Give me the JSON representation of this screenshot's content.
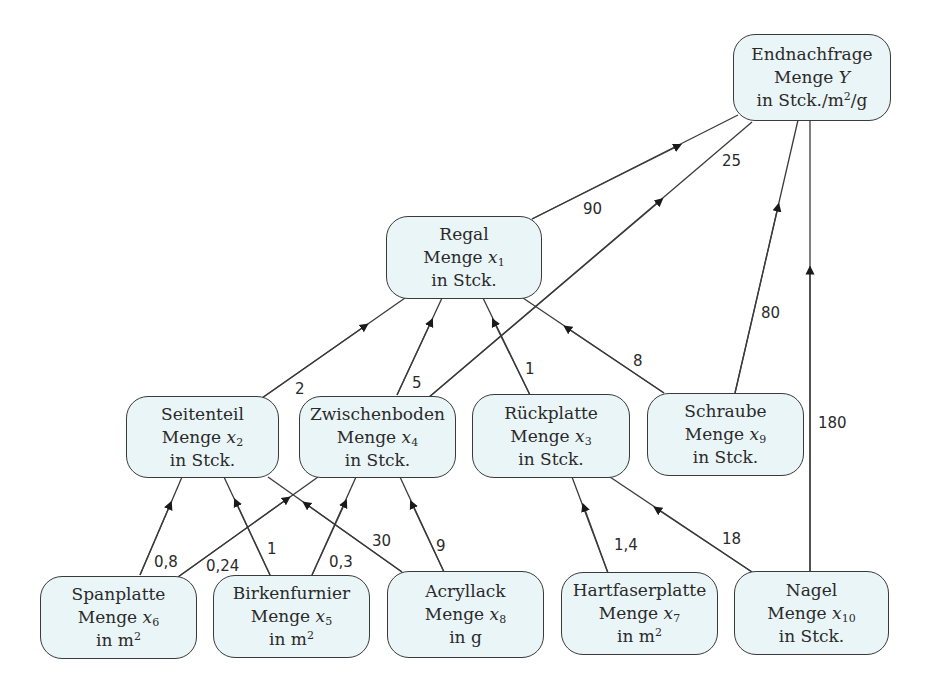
{
  "nodes": {
    "endnachfrage": {
      "title": "Endnachfrage",
      "menge_prefix": "Menge ",
      "var": "Y",
      "sub": "",
      "unit_prefix": "in Stck./m",
      "unit_sup": "2",
      "unit_suffix": "/g"
    },
    "regal": {
      "title": "Regal",
      "menge_prefix": "Menge ",
      "var": "x",
      "sub": "1",
      "unit_prefix": "in Stck.",
      "unit_sup": "",
      "unit_suffix": ""
    },
    "seitenteil": {
      "title": "Seitenteil",
      "menge_prefix": "Menge ",
      "var": "x",
      "sub": "2",
      "unit_prefix": "in Stck.",
      "unit_sup": "",
      "unit_suffix": ""
    },
    "zwischenboden": {
      "title": "Zwischenboden",
      "menge_prefix": "Menge ",
      "var": "x",
      "sub": "4",
      "unit_prefix": "in Stck.",
      "unit_sup": "",
      "unit_suffix": ""
    },
    "rueckplatte": {
      "title": "Rückplatte",
      "menge_prefix": "Menge ",
      "var": "x",
      "sub": "3",
      "unit_prefix": "in Stck.",
      "unit_sup": "",
      "unit_suffix": ""
    },
    "schraube": {
      "title": "Schraube",
      "menge_prefix": "Menge ",
      "var": "x",
      "sub": "9",
      "unit_prefix": "in Stck.",
      "unit_sup": "",
      "unit_suffix": ""
    },
    "spanplatte": {
      "title": "Spanplatte",
      "menge_prefix": "Menge ",
      "var": "x",
      "sub": "6",
      "unit_prefix": "in m",
      "unit_sup": "2",
      "unit_suffix": ""
    },
    "birkenfurnier": {
      "title": "Birkenfurnier",
      "menge_prefix": "Menge ",
      "var": "x",
      "sub": "5",
      "unit_prefix": "in m",
      "unit_sup": "2",
      "unit_suffix": ""
    },
    "acryllack": {
      "title": "Acryllack",
      "menge_prefix": "Menge ",
      "var": "x",
      "sub": "8",
      "unit_prefix": "in g",
      "unit_sup": "",
      "unit_suffix": ""
    },
    "hartfaserplatte": {
      "title": "Hartfaserplatte",
      "menge_prefix": "Menge ",
      "var": "x",
      "sub": "7",
      "unit_prefix": "in m",
      "unit_sup": "2",
      "unit_suffix": ""
    },
    "nagel": {
      "title": "Nagel",
      "menge_prefix": "Menge ",
      "var": "x",
      "sub": "10",
      "unit_prefix": "in Stck.",
      "unit_sup": "",
      "unit_suffix": ""
    }
  },
  "edges": [
    {
      "from": "regal",
      "to": "endnachfrage",
      "label": "90"
    },
    {
      "from": "zwischenboden",
      "to": "endnachfrage",
      "label": "25"
    },
    {
      "from": "schraube",
      "to": "endnachfrage",
      "label": "80"
    },
    {
      "from": "nagel",
      "to": "endnachfrage",
      "label": "180"
    },
    {
      "from": "seitenteil",
      "to": "regal",
      "label": "2"
    },
    {
      "from": "zwischenboden",
      "to": "regal",
      "label": "5"
    },
    {
      "from": "rueckplatte",
      "to": "regal",
      "label": "1"
    },
    {
      "from": "schraube",
      "to": "regal",
      "label": "8"
    },
    {
      "from": "spanplatte",
      "to": "seitenteil",
      "label": "0,8"
    },
    {
      "from": "spanplatte",
      "to": "zwischenboden",
      "label": "0,24"
    },
    {
      "from": "birkenfurnier",
      "to": "seitenteil",
      "label": "1"
    },
    {
      "from": "birkenfurnier",
      "to": "zwischenboden",
      "label": "0,3"
    },
    {
      "from": "acryllack",
      "to": "seitenteil",
      "label": "30"
    },
    {
      "from": "acryllack",
      "to": "zwischenboden",
      "label": "9"
    },
    {
      "from": "hartfaserplatte",
      "to": "rueckplatte",
      "label": "1,4"
    },
    {
      "from": "nagel",
      "to": "rueckplatte",
      "label": "18"
    }
  ],
  "colors": {
    "node_fill": "#eaf5f8",
    "stroke": "#3a3a3a",
    "arrow": "#1a1a1a"
  }
}
